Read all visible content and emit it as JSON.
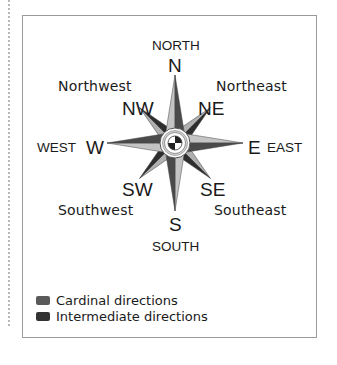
{
  "diagram": {
    "type": "compass-rose",
    "cardinal": {
      "north": {
        "abbr": "N",
        "name": "NORTH"
      },
      "south": {
        "abbr": "S",
        "name": "SOUTH"
      },
      "east": {
        "abbr": "E",
        "name": "EAST"
      },
      "west": {
        "abbr": "W",
        "name": "WEST"
      }
    },
    "intermediate": {
      "northeast": {
        "abbr": "NE",
        "name": "Northeast"
      },
      "northwest": {
        "abbr": "NW",
        "name": "Northwest"
      },
      "southeast": {
        "abbr": "SE",
        "name": "Southeast"
      },
      "southwest": {
        "abbr": "SW",
        "name": "Southwest"
      }
    },
    "colors": {
      "cardinal_light": "#bdbdbd",
      "cardinal_dark": "#4a4a4a",
      "intermediate_light": "#b0b0b0",
      "intermediate_dark": "#2e2e2e",
      "frame": "#9a9a9a"
    }
  },
  "legend": {
    "items": [
      {
        "label": "Cardinal directions",
        "color": "#5a5a5a"
      },
      {
        "label": "Intermediate directions",
        "color": "#333333"
      }
    ]
  }
}
